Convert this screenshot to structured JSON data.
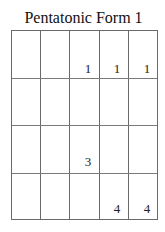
{
  "title": "Pentatonic Form 1",
  "chart": {
    "strings": 5,
    "frets": 4,
    "line_color": "#6a6a6a",
    "markers": [
      {
        "string": 3,
        "fret": 1,
        "finger": "1"
      },
      {
        "string": 4,
        "fret": 1,
        "finger": "1"
      },
      {
        "string": 5,
        "fret": 1,
        "finger": "1"
      },
      {
        "string": 3,
        "fret": 3,
        "finger": "3"
      },
      {
        "string": 4,
        "fret": 4,
        "finger": "4"
      },
      {
        "string": 5,
        "fret": 4,
        "finger": "4"
      }
    ]
  }
}
